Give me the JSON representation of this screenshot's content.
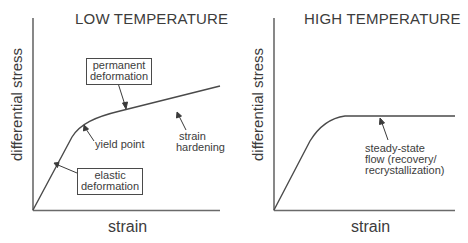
{
  "figure": {
    "panels": [
      {
        "title": "LOW TEMPERATURE",
        "xlabel": "strain",
        "ylabel": "differential stress",
        "annotations": {
          "permanent_deformation": [
            "permanent",
            "deformation"
          ],
          "strain_hardening": [
            "strain",
            "hardening"
          ],
          "yield_point": "yield point",
          "elastic_deformation": [
            "elastic",
            "deformation"
          ]
        }
      },
      {
        "title": "HIGH TEMPERATURE",
        "xlabel": "strain",
        "ylabel": "differential stress",
        "annotations": {
          "steady_state": [
            "steady-state",
            "flow (recovery/",
            "recrystallization)"
          ]
        }
      }
    ],
    "colors": {
      "line": "#4a4a4a",
      "axis": "#6a6a6a",
      "text": "#3c3c3c",
      "background": "#ffffff"
    }
  }
}
